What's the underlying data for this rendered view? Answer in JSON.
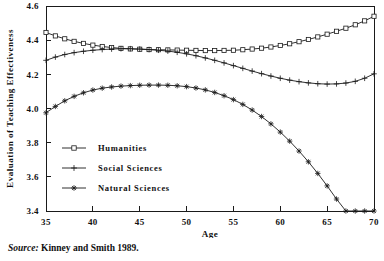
{
  "figure": {
    "source_label": "Source:",
    "source_text": "Kinney and Smith 1989."
  },
  "chart_data": {
    "type": "line",
    "title": "",
    "xlabel": "Age",
    "ylabel": "Evaluation of Teaching Effectiveness",
    "xlim": [
      35,
      70
    ],
    "ylim": [
      3.4,
      4.6
    ],
    "xticks": [
      35,
      40,
      45,
      50,
      55,
      60,
      65,
      70
    ],
    "xtick_labels": [
      "35",
      "40",
      "45",
      "50",
      "55",
      "60",
      "65",
      "70"
    ],
    "yticks": [
      3.4,
      3.6,
      3.8,
      4.0,
      4.2,
      4.4,
      4.6
    ],
    "ytick_labels": [
      "3.4",
      "3.6",
      "3.8",
      "4.0",
      "4.2",
      "4.4",
      "4.6"
    ],
    "grid": false,
    "legend_position": "lower-left",
    "line_color": "#1a1a1a",
    "x": [
      35,
      36,
      37,
      38,
      39,
      40,
      41,
      42,
      43,
      44,
      45,
      46,
      47,
      48,
      49,
      50,
      51,
      52,
      53,
      54,
      55,
      56,
      57,
      58,
      59,
      60,
      61,
      62,
      63,
      64,
      65,
      66,
      67,
      68,
      69,
      70
    ],
    "series": [
      {
        "name": "Humanities",
        "marker": "square",
        "values": [
          4.445,
          4.425,
          4.408,
          4.393,
          4.381,
          4.371,
          4.363,
          4.357,
          4.352,
          4.349,
          4.347,
          4.345,
          4.344,
          4.343,
          4.342,
          4.341,
          4.34,
          4.339,
          4.339,
          4.34,
          4.341,
          4.344,
          4.348,
          4.353,
          4.36,
          4.369,
          4.379,
          4.391,
          4.404,
          4.419,
          4.435,
          4.452,
          4.47,
          4.49,
          4.513,
          4.54
        ]
      },
      {
        "name": "Social Sciences",
        "marker": "plus",
        "values": [
          4.282,
          4.301,
          4.316,
          4.327,
          4.335,
          4.341,
          4.345,
          4.348,
          4.35,
          4.35,
          4.348,
          4.345,
          4.341,
          4.336,
          4.329,
          4.32,
          4.309,
          4.296,
          4.282,
          4.267,
          4.251,
          4.235,
          4.219,
          4.204,
          4.19,
          4.177,
          4.166,
          4.157,
          4.15,
          4.145,
          4.143,
          4.144,
          4.149,
          4.159,
          4.177,
          4.203
        ]
      },
      {
        "name": "Natural Sciences",
        "marker": "star",
        "values": [
          3.975,
          4.012,
          4.045,
          4.071,
          4.092,
          4.108,
          4.119,
          4.126,
          4.131,
          4.134,
          4.136,
          4.137,
          4.137,
          4.136,
          4.133,
          4.128,
          4.12,
          4.109,
          4.094,
          4.075,
          4.052,
          4.024,
          3.991,
          3.953,
          3.91,
          3.862,
          3.809,
          3.751,
          3.688,
          3.62,
          3.547,
          3.47,
          3.4,
          3.4,
          3.4,
          3.4
        ]
      }
    ],
    "legend": [
      {
        "label": "Humanities",
        "marker": "square"
      },
      {
        "label": "Social Sciences",
        "marker": "plus"
      },
      {
        "label": "Natural Sciences",
        "marker": "star"
      }
    ]
  }
}
